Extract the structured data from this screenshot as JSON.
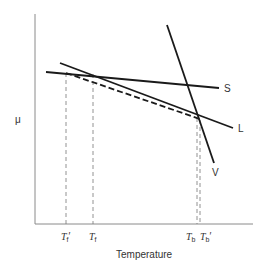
{
  "diagram": {
    "y_axis_label": "μ",
    "x_axis_label": "Temperature",
    "lines": [
      {
        "id": "S",
        "label": "S",
        "style": "solid"
      },
      {
        "id": "L",
        "label": "L",
        "style": "solid"
      },
      {
        "id": "V",
        "label": "V",
        "style": "solid"
      },
      {
        "id": "dashed",
        "label": "",
        "style": "dashed"
      }
    ],
    "ticks": [
      {
        "base": "T",
        "sub": "f",
        "prime": "′"
      },
      {
        "base": "T",
        "sub": "f",
        "prime": ""
      },
      {
        "base": "T",
        "sub": "b",
        "prime": ""
      },
      {
        "base": "T",
        "sub": "b",
        "prime": "′"
      }
    ],
    "colors": {
      "line": "#1a1a1a",
      "axis": "#888888",
      "text": "#333333"
    }
  }
}
